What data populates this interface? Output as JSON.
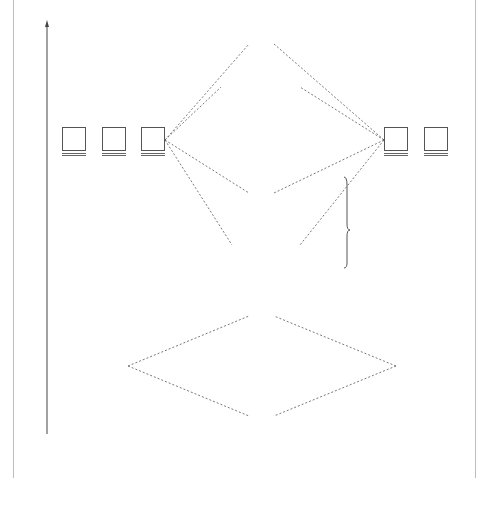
{
  "diagram": {
    "type": "molecular-orbital-energy-diagram",
    "axis": {
      "label": "Energy",
      "direction": "up"
    },
    "columns": {
      "left": [
        "Atomic",
        "orbitals"
      ],
      "middle": [
        "Molecular",
        "orbitals"
      ],
      "right": [
        "Atomic",
        "orbitals"
      ]
    },
    "atomic_left": {
      "p_orbitals": [
        {
          "label": "2p",
          "sub": "x"
        },
        {
          "label": "2p",
          "sub": "y"
        },
        {
          "label": "2p",
          "sub": "z"
        }
      ],
      "s_orbital": {
        "label": "2s"
      }
    },
    "atomic_right": {
      "p_orbitals": [
        {
          "label": "2p",
          "sub": "x"
        },
        {
          "label": "2p",
          "sub": "y"
        },
        {
          "label": "2p",
          "sub": "z"
        }
      ],
      "s_orbital": {
        "label": "2s"
      }
    },
    "molecular": [
      {
        "id": "sigma_star_2px",
        "symbol": "σ",
        "star": "*",
        "sub": "2p",
        "subsub": "x"
      },
      {
        "id": "pi_star_2py",
        "symbol": "π",
        "star": "*",
        "sub": "2p",
        "subsub": "y"
      },
      {
        "id": "pi_star_2pz",
        "symbol": "π",
        "star": "*",
        "sub": "2p",
        "subsub": "z"
      },
      {
        "id": "sigma_2px",
        "symbol": "σ",
        "star": "",
        "sub": "2p",
        "subsub": "x"
      },
      {
        "id": "pi_2py",
        "symbol": "π",
        "star": "",
        "sub": "2p",
        "subsub": "y"
      },
      {
        "id": "pi_2pz",
        "symbol": "π",
        "star": "",
        "sub": "2p",
        "subsub": "z"
      },
      {
        "id": "sigma_star_2s",
        "symbol": "σ",
        "star": "*",
        "sub": "2s",
        "subsub": ""
      },
      {
        "id": "sigma_2s",
        "symbol": "σ",
        "star": "",
        "sub": "2s",
        "subsub": ""
      }
    ],
    "note": {
      "lines": [
        "these levels",
        "reversed",
        "for O",
        "and F"
      ],
      "subs": [
        "",
        "",
        "2",
        "2"
      ]
    }
  }
}
